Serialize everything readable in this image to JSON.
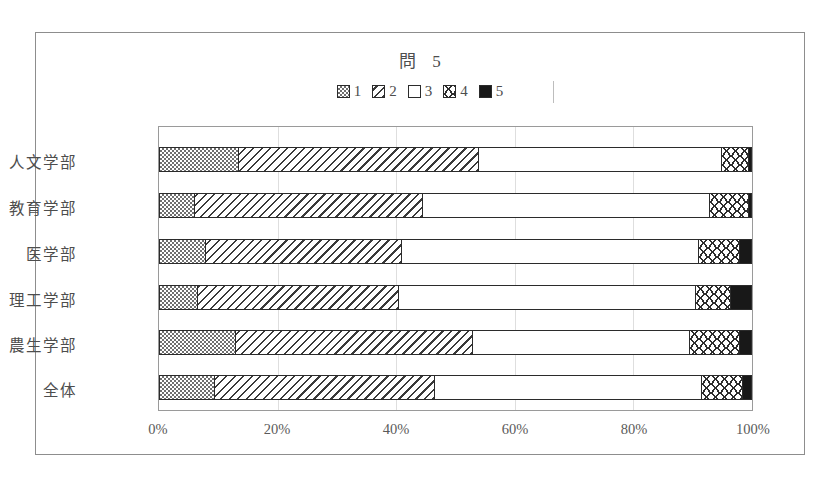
{
  "chart_data": {
    "type": "bar",
    "orientation": "horizontal",
    "stacked": true,
    "normalized": true,
    "title_main": "問",
    "title_number": "5",
    "xlabel": "",
    "ylabel": "",
    "xlim": [
      0,
      100
    ],
    "xticks": [
      "0%",
      "20%",
      "40%",
      "60%",
      "80%",
      "100%"
    ],
    "xtick_values": [
      0,
      20,
      40,
      60,
      80,
      100
    ],
    "grid": true,
    "legend_position": "top",
    "legend": [
      "1",
      "2",
      "3",
      "4",
      "5"
    ],
    "categories": [
      "人文学部",
      "教育学部",
      "医学部",
      "理工学部",
      "農生学部",
      "全体"
    ],
    "series": [
      {
        "name": "1",
        "pattern": "checkerboard",
        "values": [
          13.5,
          6.0,
          8.0,
          6.5,
          13.0,
          9.5
        ]
      },
      {
        "name": "2",
        "pattern": "diagonal-hatch",
        "values": [
          40.5,
          38.5,
          33.0,
          34.0,
          40.0,
          37.0
        ]
      },
      {
        "name": "3",
        "pattern": "white",
        "values": [
          41.0,
          48.5,
          50.0,
          50.0,
          36.5,
          45.0
        ]
      },
      {
        "name": "4",
        "pattern": "wavy-zigzag",
        "values": [
          4.5,
          6.5,
          7.0,
          6.0,
          8.5,
          7.0
        ]
      },
      {
        "name": "5",
        "pattern": "solid-black",
        "values": [
          0.5,
          0.5,
          2.0,
          3.5,
          2.0,
          1.5
        ]
      }
    ]
  }
}
